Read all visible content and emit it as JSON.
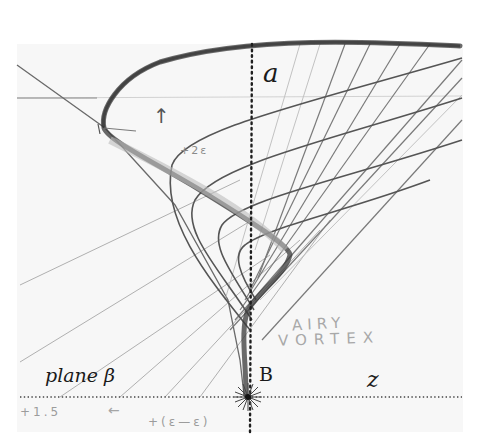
{
  "diagram": {
    "labels": {
      "axis_a": "a",
      "plane": "plane β",
      "point": "B",
      "axis_z": "z"
    },
    "pencil_notes": {
      "title_line1": "AIRY",
      "title_line2": "VORTEX",
      "bottom_left": "+1.5",
      "bottom_arrow": "←",
      "bottom_center": "+(ε—ε)",
      "curve_note": "+2ε",
      "up_arrow": "↑"
    },
    "colors": {
      "background": "#ffffff",
      "paper": "#f7f7f7",
      "graphite_dark": "#2a2a2a",
      "graphite_light": "#9a9a9a"
    }
  }
}
